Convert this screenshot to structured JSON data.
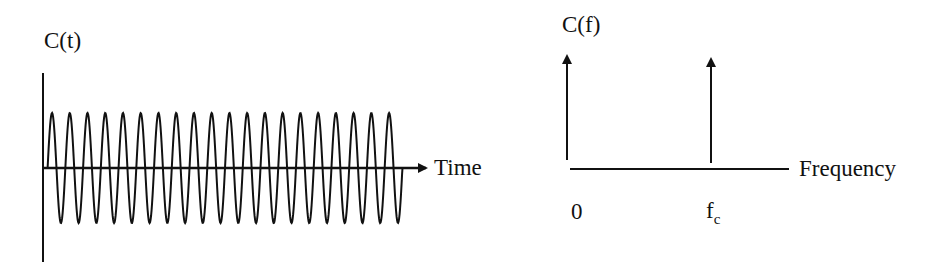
{
  "left_panel": {
    "y_label": "C(t)",
    "x_label": "Time",
    "description": "Carrier signal in time domain: a constant-amplitude sinusoid",
    "cycles": 20
  },
  "right_panel": {
    "y_label": "C(f)",
    "x_label": "Frequency",
    "tick_zero": "0",
    "tick_fc_main": "f",
    "tick_fc_sub": "c",
    "description": "Carrier spectrum: impulses at 0 and at the carrier frequency fc"
  },
  "chart_data": [
    {
      "type": "line",
      "title": "",
      "ylabel": "C(t)",
      "xlabel": "Time",
      "function": "sin",
      "cycles": 20,
      "amplitude": 1,
      "grid": false
    },
    {
      "type": "bar",
      "title": "",
      "ylabel": "C(f)",
      "xlabel": "Frequency",
      "categories": [
        "0",
        "fc"
      ],
      "values": [
        1,
        1
      ],
      "style": "impulse arrows",
      "grid": false
    }
  ],
  "colors": {
    "ink": "#111111",
    "background": "#ffffff"
  }
}
